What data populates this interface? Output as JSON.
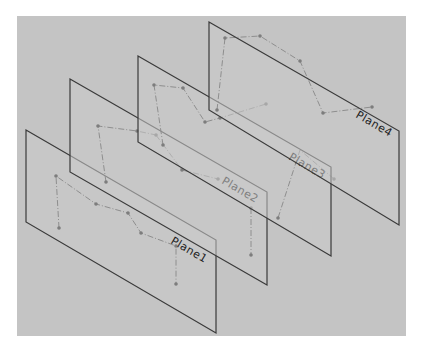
{
  "viewport": {
    "background_color": "#c4c4c4",
    "page_color": "#ffffff",
    "bounds": {
      "x": 17,
      "y": 16,
      "width": 389,
      "height": 320
    }
  },
  "planes": [
    {
      "name": "Plane1",
      "corners": [
        [
          26,
          130
        ],
        [
          216,
          240
        ],
        [
          216,
          333
        ],
        [
          26,
          222
        ]
      ],
      "label": "Plane1",
      "label_pos": [
        170,
        243
      ],
      "sketch_points": [
        [
          56,
          176
        ],
        [
          59,
          228
        ],
        [
          96,
          204
        ],
        [
          128,
          213
        ],
        [
          141,
          233
        ],
        [
          176,
          246
        ],
        [
          176,
          284
        ]
      ]
    },
    {
      "name": "Plane2",
      "corners": [
        [
          70,
          79
        ],
        [
          267,
          192
        ],
        [
          267,
          285
        ],
        [
          70,
          172
        ]
      ],
      "label": "Plane2",
      "label_pos": [
        221,
        183
      ],
      "sketch_points": [
        [
          98,
          126
        ],
        [
          106,
          182
        ],
        [
          137,
          131
        ],
        [
          156,
          135
        ],
        [
          182,
          170
        ],
        [
          218,
          179
        ],
        [
          251,
          208
        ],
        [
          251,
          255
        ]
      ]
    },
    {
      "name": "Plane3",
      "corners": [
        [
          138,
          56
        ],
        [
          331,
          167
        ],
        [
          331,
          256
        ],
        [
          138,
          142
        ]
      ],
      "label": "Plane3",
      "label_pos": [
        288,
        159
      ],
      "sketch_points": [
        [
          154,
          85
        ],
        [
          163,
          145
        ],
        [
          183,
          88
        ],
        [
          205,
          122
        ],
        [
          220,
          118
        ],
        [
          266,
          104
        ],
        [
          278,
          218
        ],
        [
          334,
          179
        ]
      ]
    },
    {
      "name": "Plane4",
      "corners": [
        [
          209,
          22
        ],
        [
          399,
          131
        ],
        [
          399,
          225
        ],
        [
          209,
          110
        ]
      ],
      "label": "Plane4",
      "label_pos": [
        355,
        117
      ],
      "sketch_points": [
        [
          225,
          38
        ],
        [
          217,
          110
        ],
        [
          260,
          36
        ],
        [
          300,
          61
        ],
        [
          323,
          113
        ],
        [
          372,
          107
        ]
      ]
    }
  ],
  "sketch_segments": [
    {
      "plane": "Plane1",
      "points": [
        [
          59,
          228
        ],
        [
          56,
          176
        ],
        [
          96,
          204
        ],
        [
          128,
          213
        ],
        [
          141,
          233
        ],
        [
          176,
          246
        ],
        [
          176,
          284
        ]
      ]
    },
    {
      "plane": "Plane2",
      "points": [
        [
          106,
          182
        ],
        [
          98,
          126
        ],
        [
          137,
          131
        ],
        [
          156,
          135
        ]
      ]
    },
    {
      "plane": "Plane2",
      "points": [
        [
          156,
          135
        ],
        [
          182,
          170
        ],
        [
          218,
          179
        ]
      ]
    },
    {
      "plane": "Plane2",
      "points": [
        [
          251,
          208
        ],
        [
          251,
          255
        ]
      ]
    },
    {
      "plane": "Plane3",
      "points": [
        [
          163,
          145
        ],
        [
          154,
          85
        ],
        [
          183,
          88
        ],
        [
          205,
          122
        ],
        [
          220,
          118
        ],
        [
          266,
          104
        ]
      ]
    },
    {
      "plane": "Plane3",
      "points": [
        [
          334,
          179
        ],
        [
          300,
          150
        ],
        [
          278,
          218
        ]
      ]
    },
    {
      "plane": "Plane4",
      "points": [
        [
          217,
          110
        ],
        [
          225,
          38
        ],
        [
          260,
          36
        ],
        [
          300,
          61
        ],
        [
          323,
          113
        ],
        [
          372,
          107
        ]
      ]
    }
  ]
}
